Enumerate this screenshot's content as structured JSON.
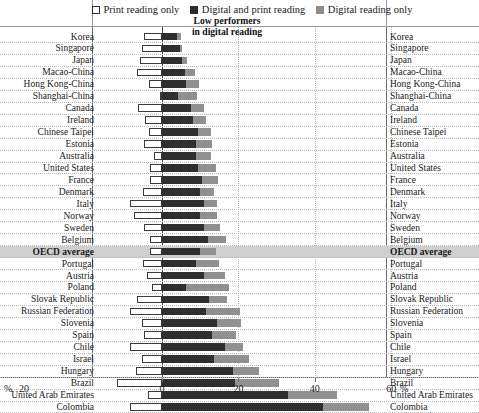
{
  "legend": {
    "items": [
      {
        "key": "print",
        "label": "Print reading only",
        "color": "#ffffff",
        "icon": "square-outline-icon"
      },
      {
        "key": "both",
        "label": "Digital and print reading",
        "color": "#2f2f2f",
        "icon": "square-filled-dark-icon"
      },
      {
        "key": "digital",
        "label": "Digital reading only",
        "color": "#909090",
        "icon": "square-filled-gray-icon"
      }
    ]
  },
  "annotation": {
    "line1": "Low performers",
    "line2": "in digital reading"
  },
  "axis": {
    "ticks": [
      "0",
      "20",
      "40",
      "60"
    ],
    "unit": "%",
    "unit_left": "%",
    "left_top_label": "20"
  },
  "chart_data": {
    "type": "bar",
    "title": "Low performers in digital reading",
    "subtitle": "",
    "xlabel": "%",
    "ylabel": "",
    "orientation": "horizontal",
    "stacked": true,
    "diverging": true,
    "xlim": [
      -10,
      60
    ],
    "grid": true,
    "legend_position": "top",
    "series": [
      {
        "name": "Print reading only",
        "color": "#ffffff",
        "direction": "left"
      },
      {
        "name": "Digital and print reading",
        "color": "#2f2f2f",
        "direction": "right"
      },
      {
        "name": "Digital reading only",
        "color": "#909090",
        "direction": "right"
      }
    ],
    "categories": [
      "Korea",
      "Singapore",
      "Japan",
      "Macao-China",
      "Hong Kong-China",
      "Shanghai-China",
      "Canada",
      "Ireland",
      "Chinese Taipei",
      "Estonia",
      "Australia",
      "United States",
      "France",
      "Denmark",
      "Italy",
      "Norway",
      "Sweden",
      "Belgium",
      "OECD average",
      "Portugal",
      "Austria",
      "Poland",
      "Slovak Republic",
      "Russian Federation",
      "Slovenia",
      "Spain",
      "Chile",
      "Israel",
      "Hungary",
      "Brazil",
      "United Arab Emirates",
      "Colombia"
    ],
    "rows": [
      {
        "country": "Korea",
        "print": 4.6,
        "both": 3.8,
        "digital": 1.1,
        "highlight": false
      },
      {
        "country": "Singapore",
        "print": 5.3,
        "both": 4.8,
        "digital": 0.5,
        "highlight": false
      },
      {
        "country": "Japan",
        "print": 5.8,
        "both": 5.3,
        "digital": 1.3,
        "highlight": false
      },
      {
        "country": "Macao-China",
        "print": 6.6,
        "both": 6.1,
        "digital": 2.6,
        "highlight": false
      },
      {
        "country": "Hong Kong-China",
        "print": 3.4,
        "both": 6.3,
        "digital": 3.4,
        "highlight": false
      },
      {
        "country": "Shanghai-China",
        "print": 0.5,
        "both": 4.2,
        "digital": 5.0,
        "highlight": false
      },
      {
        "country": "Canada",
        "print": 6.3,
        "both": 7.6,
        "digital": 3.4,
        "highlight": false
      },
      {
        "country": "Ireland",
        "print": 4.5,
        "both": 8.2,
        "digital": 3.2,
        "highlight": false
      },
      {
        "country": "Chinese Taipei",
        "print": 3.4,
        "both": 9.5,
        "digital": 3.2,
        "highlight": false
      },
      {
        "country": "Estonia",
        "print": 4.7,
        "both": 9.0,
        "digital": 4.2,
        "highlight": false
      },
      {
        "country": "Australia",
        "print": 2.1,
        "both": 9.0,
        "digital": 3.9,
        "highlight": false
      },
      {
        "country": "United States",
        "print": 3.2,
        "both": 9.5,
        "digital": 4.7,
        "highlight": false
      },
      {
        "country": "France",
        "print": 3.2,
        "both": 10.5,
        "digital": 4.2,
        "highlight": false
      },
      {
        "country": "Denmark",
        "print": 5.0,
        "both": 10.0,
        "digital": 3.7,
        "highlight": false
      },
      {
        "country": "Italy",
        "print": 8.4,
        "both": 11.1,
        "digital": 3.4,
        "highlight": false
      },
      {
        "country": "Norway",
        "print": 7.4,
        "both": 10.0,
        "digital": 4.5,
        "highlight": false
      },
      {
        "country": "Sweden",
        "print": 4.7,
        "both": 11.1,
        "digital": 4.2,
        "highlight": false
      },
      {
        "country": "Belgium",
        "print": 3.2,
        "both": 12.1,
        "digital": 4.7,
        "highlight": false
      },
      {
        "country": "OECD average",
        "print": 3.2,
        "both": 10.0,
        "digital": 4.2,
        "highlight": true
      },
      {
        "country": "Portugal",
        "print": 5.0,
        "both": 8.9,
        "digital": 6.1,
        "highlight": false
      },
      {
        "country": "Austria",
        "print": 4.0,
        "both": 11.1,
        "digital": 5.3,
        "highlight": false
      },
      {
        "country": "Poland",
        "print": 2.6,
        "both": 6.3,
        "digital": 11.3,
        "highlight": false
      },
      {
        "country": "Slovak Republic",
        "print": 6.6,
        "both": 12.4,
        "digital": 4.7,
        "highlight": false
      },
      {
        "country": "Russian Federation",
        "print": 8.4,
        "both": 11.6,
        "digital": 8.7,
        "highlight": false
      },
      {
        "country": "Slovenia",
        "print": 5.3,
        "both": 14.5,
        "digital": 6.3,
        "highlight": false
      },
      {
        "country": "Spain",
        "print": 4.7,
        "both": 13.2,
        "digital": 6.1,
        "highlight": false
      },
      {
        "country": "Chile",
        "print": 8.4,
        "both": 16.6,
        "digital": 4.5,
        "highlight": false
      },
      {
        "country": "Israel",
        "print": 5.3,
        "both": 13.7,
        "digital": 9.2,
        "highlight": false
      },
      {
        "country": "Chinese hidden",
        "print": 0,
        "both": 0,
        "digital": 0,
        "highlight": false
      }
    ],
    "values_print": [
      4.6,
      5.3,
      5.8,
      6.6,
      3.4,
      0.5,
      6.3,
      4.5,
      3.4,
      4.7,
      2.1,
      3.2,
      3.2,
      5.0,
      8.4,
      7.4,
      4.7,
      3.2,
      3.2,
      5.0,
      4.0,
      2.6,
      6.6,
      8.4,
      5.3,
      4.7,
      8.4,
      5.3,
      6.8,
      11.8,
      3.7,
      8.4
    ],
    "values_both": [
      3.8,
      4.8,
      5.3,
      6.1,
      6.3,
      4.2,
      7.6,
      8.2,
      9.5,
      9.0,
      9.0,
      9.5,
      10.5,
      10.0,
      11.1,
      10.0,
      11.1,
      12.1,
      10.0,
      8.9,
      11.1,
      6.3,
      12.4,
      11.6,
      14.5,
      13.2,
      16.6,
      13.7,
      18.7,
      19.2,
      32.9,
      42.1
    ],
    "values_digital": [
      1.1,
      0.5,
      1.3,
      2.6,
      3.4,
      5.0,
      3.4,
      3.2,
      3.2,
      4.2,
      3.9,
      4.7,
      4.2,
      3.7,
      3.4,
      4.5,
      4.2,
      4.7,
      4.2,
      6.1,
      5.3,
      11.3,
      4.7,
      8.7,
      6.3,
      6.1,
      4.5,
      9.2,
      6.6,
      11.3,
      12.9,
      12.1
    ]
  }
}
